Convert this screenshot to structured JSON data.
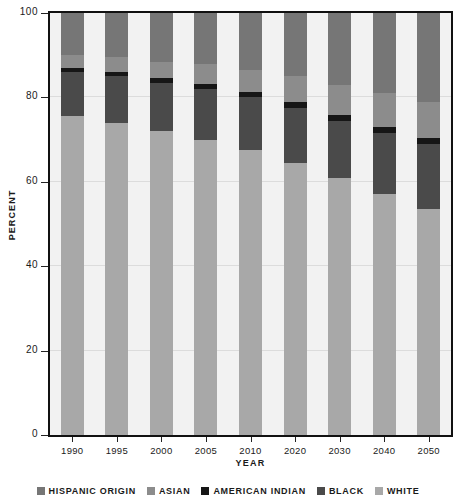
{
  "chart_data": {
    "type": "bar",
    "subtype": "stacked-percent",
    "title": "",
    "xlabel": "Year",
    "ylabel": "Percent",
    "ylim": [
      0,
      100
    ],
    "yticks": [
      0,
      20,
      40,
      60,
      80,
      100
    ],
    "ytick_labels": [
      "0",
      "20",
      "40",
      "60",
      "80",
      "100"
    ],
    "grid": true,
    "legend_position": "bottom",
    "categories": [
      "1990",
      "1995",
      "2000",
      "2005",
      "2010",
      "2020",
      "2030",
      "2040",
      "2050"
    ],
    "stack_order_bottom_to_top": [
      "White",
      "Black",
      "American Indian",
      "Asian",
      "Hispanic Origin"
    ],
    "series": [
      {
        "name": "White",
        "color": "#a8a8a8",
        "values": [
          75.5,
          74.0,
          72.0,
          70.0,
          67.5,
          64.5,
          61.0,
          57.0,
          53.5
        ]
      },
      {
        "name": "Black",
        "color": "#4a4a4a",
        "values": [
          10.5,
          11.0,
          11.5,
          12.0,
          12.5,
          13.0,
          13.5,
          14.5,
          15.5
        ]
      },
      {
        "name": "American Indian",
        "color": "#161616",
        "values": [
          1.0,
          1.0,
          1.0,
          1.2,
          1.2,
          1.3,
          1.4,
          1.5,
          1.5
        ]
      },
      {
        "name": "Asian",
        "color": "#8c8c8c",
        "values": [
          3.0,
          3.5,
          4.0,
          4.8,
          5.3,
          6.2,
          7.1,
          8.0,
          8.5
        ]
      },
      {
        "name": "Hispanic Origin",
        "color": "#767676",
        "values": [
          10.0,
          10.5,
          11.5,
          12.0,
          13.5,
          15.0,
          17.0,
          19.0,
          21.0
        ]
      }
    ]
  },
  "legend": {
    "items": [
      {
        "label": "Hispanic Origin",
        "color": "#767676"
      },
      {
        "label": "Asian",
        "color": "#8c8c8c"
      },
      {
        "label": "American Indian",
        "color": "#161616"
      },
      {
        "label": "Black",
        "color": "#4a4a4a"
      },
      {
        "label": "White",
        "color": "#a8a8a8"
      }
    ]
  },
  "axes": {
    "y_title": "Percent",
    "x_title": "Year"
  }
}
